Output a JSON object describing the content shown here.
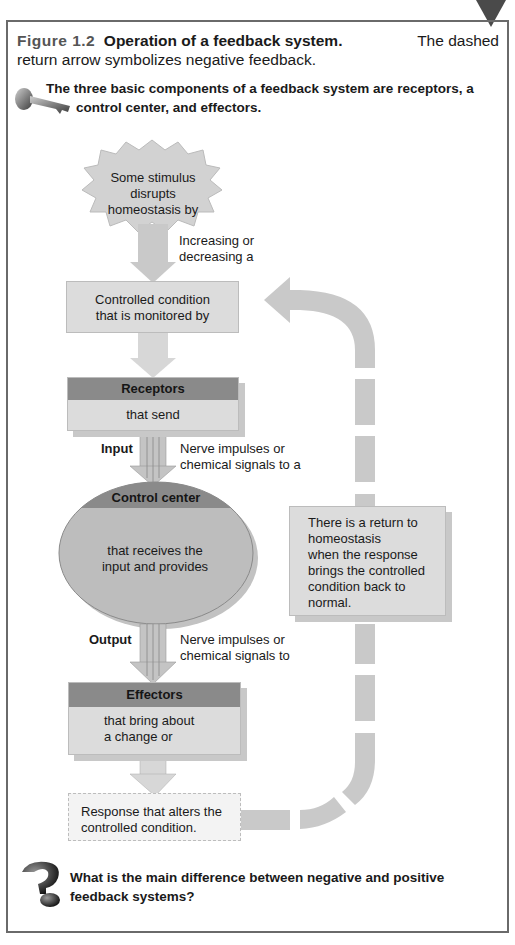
{
  "figure": {
    "number": "Figure 1.2",
    "title": "Operation of a feedback system.",
    "caption_line1_rest": "The dashed",
    "caption_line2": "return arrow symbolizes negative feedback."
  },
  "key_point": {
    "icon": "key-icon",
    "line1": "The three basic components of a feedback system are receptors, a",
    "line2": "control center, and effectors."
  },
  "diagram": {
    "stimulus": {
      "line1": "Some stimulus",
      "line2": "disrupts homeostasis by"
    },
    "stimulus_arrow_label": {
      "line1": "Increasing or",
      "line2": "decreasing a"
    },
    "controlled_condition": {
      "line1": "Controlled condition",
      "line2": "that is monitored by"
    },
    "receptors": {
      "header": "Receptors",
      "body": "that send"
    },
    "input": {
      "label": "Input",
      "desc_line1": "Nerve impulses or",
      "desc_line2": "chemical signals to a"
    },
    "control_center": {
      "header": "Control center",
      "body_line1": "that receives the",
      "body_line2": "input and provides"
    },
    "output": {
      "label": "Output",
      "desc_line1": "Nerve impulses or",
      "desc_line2": "chemical signals to"
    },
    "effectors": {
      "header": "Effectors",
      "body_line1": "that bring about",
      "body_line2": "a change or"
    },
    "response": {
      "line1": "Response that alters the",
      "line2": "controlled condition."
    },
    "return_note": {
      "lines": [
        "There is a return to",
        "homeostasis",
        "when the response",
        "brings the controlled",
        "condition back to",
        "normal."
      ]
    }
  },
  "question": {
    "icon": "question-mark-icon",
    "line1": "What is the main difference between negative and positive",
    "line2": "feedback systems?"
  },
  "colors": {
    "frame": "#6a6a6a",
    "box_fill": "#dcdcdc",
    "header_fill": "#8a8a8a",
    "arrow_fill": "#c9c9c9"
  }
}
